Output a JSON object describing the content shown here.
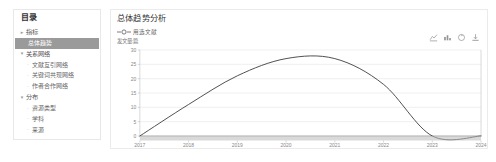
{
  "sidebar": {
    "title": "目录",
    "groups": [
      {
        "label": "指标",
        "caret": "▸",
        "items": [
          {
            "label": "总体趋势",
            "active": true
          }
        ]
      },
      {
        "label": "关系网络",
        "caret": "▾",
        "items": [
          {
            "label": "文献互引网络",
            "active": false
          },
          {
            "label": "关键词共现网络",
            "active": false
          },
          {
            "label": "作者合作网络",
            "active": false
          }
        ]
      },
      {
        "label": "分布",
        "caret": "▾",
        "items": [
          {
            "label": "资源类型",
            "active": false
          },
          {
            "label": "学科",
            "active": false
          },
          {
            "label": "来源",
            "active": false
          }
        ]
      }
    ]
  },
  "chart_panel": {
    "title": "总体趋势分析",
    "toolbox": [
      {
        "name": "line-chart-icon",
        "title": "切换为折线图"
      },
      {
        "name": "bar-chart-icon",
        "title": "切换为柱状图"
      },
      {
        "name": "restore-icon",
        "title": "还原"
      },
      {
        "name": "download-icon",
        "title": "保存为图片"
      }
    ]
  },
  "chart_data": {
    "type": "line",
    "title": "总体趋势分析",
    "subtitle": "",
    "xlabel": "",
    "ylabel": "发文量:篇",
    "legend": [
      "用选文献"
    ],
    "legend_position": "top-left",
    "grid": true,
    "smooth": true,
    "line_color": "#3c3c3c",
    "x": [
      "2017",
      "2018",
      "2019",
      "2020",
      "2021",
      "2022",
      "2023",
      "2024"
    ],
    "categories": [
      "2017",
      "2018",
      "2019",
      "2020",
      "2021",
      "2022",
      "2023",
      "2024"
    ],
    "values": [
      0,
      11,
      21,
      27,
      27,
      18,
      0,
      0
    ],
    "series": [
      {
        "name": "用选文献",
        "values": [
          0,
          11,
          21,
          27,
          27,
          18,
          0,
          0
        ]
      }
    ],
    "yticks": [
      0,
      5,
      10,
      15,
      20,
      25,
      30
    ],
    "ylim": [
      0,
      30
    ],
    "xlim": [
      "2017",
      "2024"
    ]
  }
}
